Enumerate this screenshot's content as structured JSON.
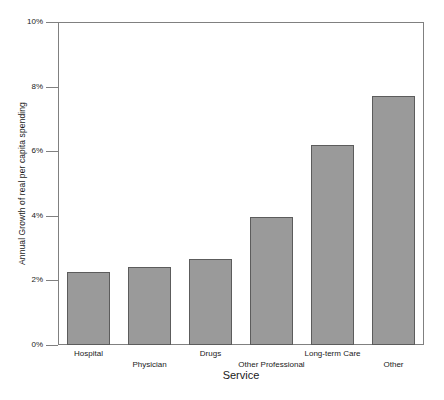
{
  "chart_data": {
    "type": "bar",
    "title": "",
    "xlabel": "Service",
    "ylabel": "Annual Growth of real per capita spending",
    "categories": [
      "Hospital",
      "Physician",
      "Drugs",
      "Other Professional",
      "Long-term Care",
      "Other"
    ],
    "values": [
      2.25,
      2.4,
      2.65,
      3.95,
      6.2,
      7.7
    ],
    "ylim": [
      0,
      10
    ],
    "ytick_values": [
      0,
      2,
      4,
      6,
      8,
      10
    ],
    "ytick_labels": [
      "0%",
      "2%",
      "4%",
      "6%",
      "8%",
      "10%"
    ],
    "grid": false,
    "legend": false,
    "legend_position": "none",
    "bar_color": "#9a9a9a",
    "bar_edge_color": "#5c5c5c",
    "axis_color": "#808080",
    "background_color": "#ffffff",
    "xtick_label_rows": [
      0,
      1,
      0,
      1,
      0,
      1
    ]
  }
}
